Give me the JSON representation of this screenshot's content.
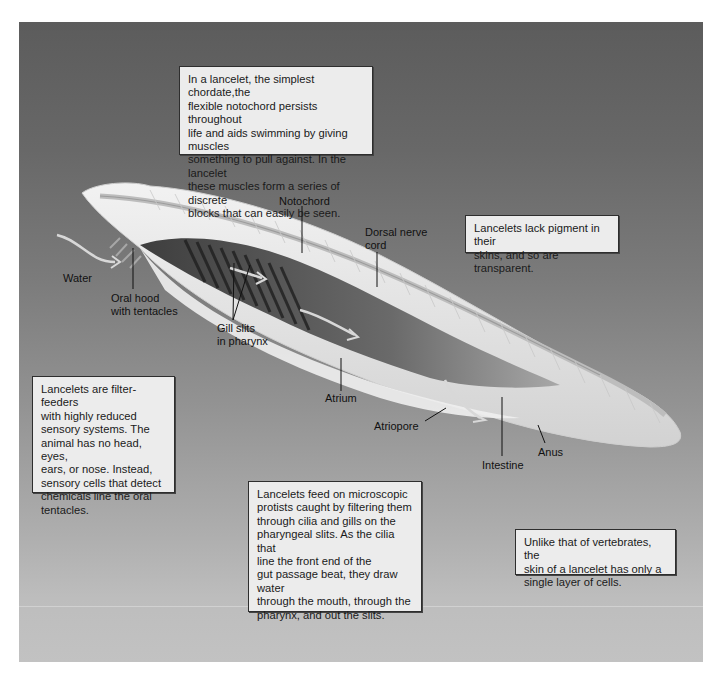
{
  "figure": {
    "colors": {
      "background_top": "#5c5c5c",
      "background_bottom": "#c2c2c2",
      "note_fill": "#ececec",
      "note_border": "#2e2e2e",
      "body_fill": "#e6e6e6"
    }
  },
  "notes": {
    "notochord_note": "In a lancelet, the simplest chordate,the\nflexible notochord persists throughout\nlife and aids swimming by giving muscles\nsomething to pull against. In the lancelet\nthese muscles form a series of discrete\nblocks that can easily be seen.",
    "pigment_note": "Lancelets lack pigment in their\nskins, and so are transparent.",
    "filter_feeder_note": "Lancelets are filter-feeders\nwith highly reduced\nsensory systems. The\nanimal has no head, eyes,\nears, or nose. Instead,\nsensory cells that detect\nchemicals line the oral\ntentacles.",
    "feeding_note": "Lancelets feed on microscopic\nprotists caught by filtering them\nthrough cilia and gills on the\npharyngeal slits. As the cilia that\nline the front end of the\ngut passage beat, they draw water\nthrough the mouth, through the\npharynx, and out the slits.",
    "skin_note": "Unlike that of vertebrates, the\nskin of a lancelet  has only a\nsingle layer of cells."
  },
  "labels": {
    "notochord": "Notochord",
    "dorsal_nerve_cord": "Dorsal nerve\ncord",
    "water": "Water",
    "oral_hood": "Oral hood\nwith tentacles",
    "gill_slits": "Gill slits\nin pharynx",
    "atrium": "Atrium",
    "atriopore": "Atriopore",
    "intestine": "Intestine",
    "anus": "Anus"
  }
}
